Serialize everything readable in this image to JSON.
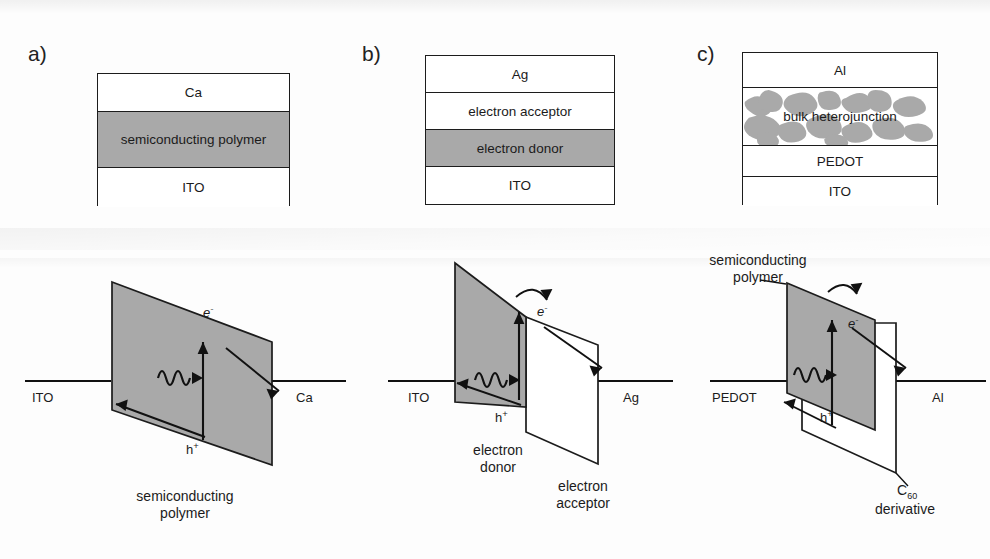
{
  "figure": {
    "kind": "organic-solar-cell-architectures",
    "panels": [
      {
        "label": "a)",
        "device_stack": {
          "layers": [
            {
              "name": "Ca",
              "fill": "white"
            },
            {
              "name": "semiconducting polymer",
              "fill": "gray"
            },
            {
              "name": "ITO",
              "fill": "white"
            }
          ]
        },
        "energy_diagram": {
          "anode_label": "ITO",
          "cathode_label": "Ag",
          "left_electrode_label": "ITO",
          "right_electrode_label": "Ca",
          "electron_label": "e",
          "electron_charge": "-",
          "hole_label": "h",
          "hole_charge": "+",
          "caption_line1": "semiconducting",
          "caption_line2": "polymer",
          "slabs": [
            {
              "name": "semiconducting polymer",
              "fill": "gray"
            }
          ]
        }
      },
      {
        "label": "b)",
        "device_stack": {
          "layers": [
            {
              "name": "Ag",
              "fill": "white"
            },
            {
              "name": "electron acceptor",
              "fill": "white"
            },
            {
              "name": "electron donor",
              "fill": "gray"
            },
            {
              "name": "ITO",
              "fill": "white"
            }
          ]
        },
        "energy_diagram": {
          "left_electrode_label": "ITO",
          "right_electrode_label": "Ag",
          "electron_label": "e",
          "electron_charge": "-",
          "hole_label": "h",
          "hole_charge": "+",
          "caption_donor_line1": "electron",
          "caption_donor_line2": "donor",
          "caption_acceptor_line1": "electron",
          "caption_acceptor_line2": "acceptor",
          "slabs": [
            {
              "name": "electron donor",
              "fill": "gray"
            },
            {
              "name": "electron acceptor",
              "fill": "white"
            }
          ]
        }
      },
      {
        "label": "c)",
        "device_stack": {
          "layers": [
            {
              "name": "Al",
              "fill": "white"
            },
            {
              "name": "bulk heterojunction",
              "fill": "blend"
            },
            {
              "name": "PEDOT",
              "fill": "white"
            },
            {
              "name": "ITO",
              "fill": "white"
            }
          ]
        },
        "energy_diagram": {
          "left_electrode_label": "PEDOT",
          "right_electrode_label": "Al",
          "electron_label": "e",
          "electron_charge": "-",
          "hole_label": "h",
          "hole_charge": "+",
          "caption_top_line1": "semiconducting",
          "caption_top_line2": "polymer",
          "caption_c60_main": "C",
          "caption_c60_sub": "60",
          "caption_c60_line2": "derivative",
          "slabs": [
            {
              "name": "semiconducting polymer",
              "fill": "gray"
            },
            {
              "name": "C60 derivative",
              "fill": "white"
            }
          ]
        }
      }
    ],
    "colors": {
      "gray_fill": "#a9a9a9",
      "white_fill": "#ffffff",
      "ink": "#1c1c1c",
      "background": "#fdfdfd"
    }
  }
}
